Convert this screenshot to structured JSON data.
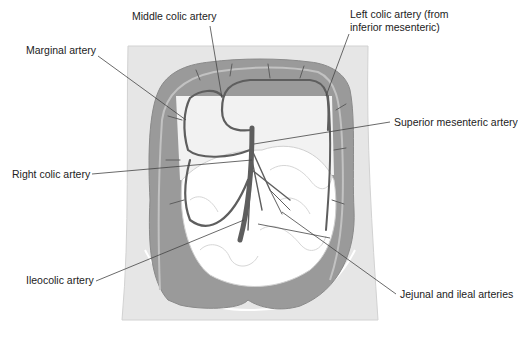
{
  "diagram": {
    "colors": {
      "background": "#ffffff",
      "body_outline_fill": "#e6e6e6",
      "colon_fill": "#9a9a9a",
      "colon_band": "#b8b8b8",
      "small_intestine_fill": "#ffffff",
      "mesentery_fill": "#f2f2f2",
      "artery_stroke": "#5e5e5e",
      "leader_line": "#444444",
      "label_text": "#222222"
    },
    "labels": [
      {
        "id": "middle-colic",
        "text": "Middle colic artery"
      },
      {
        "id": "marginal",
        "text": "Marginal artery"
      },
      {
        "id": "left-colic-line1",
        "text": "Left colic artery (from"
      },
      {
        "id": "left-colic-line2",
        "text": "inferior mesenteric)"
      },
      {
        "id": "superior-mesenteric",
        "text": "Superior mesenteric artery"
      },
      {
        "id": "right-colic",
        "text": "Right colic artery"
      },
      {
        "id": "ileocolic",
        "text": "Ileocolic artery"
      },
      {
        "id": "jejunal-ileal",
        "text": "Jejunal and ileal arteries"
      }
    ]
  }
}
